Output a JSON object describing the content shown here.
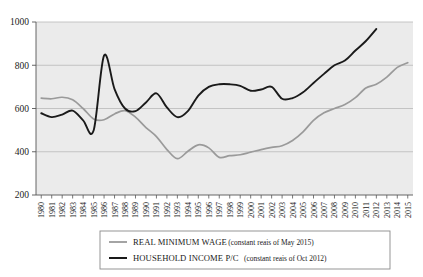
{
  "chart_data": {
    "type": "line",
    "title": "",
    "xlabel": "",
    "ylabel": "",
    "ylim": [
      200,
      1000
    ],
    "yticks": [
      200,
      400,
      600,
      800,
      1000
    ],
    "grid": true,
    "legend_position": "bottom",
    "plot_background": "#ebebeb",
    "x": [
      1980,
      1981,
      1982,
      1983,
      1984,
      1985,
      1986,
      1987,
      1988,
      1989,
      1990,
      1991,
      1992,
      1993,
      1994,
      1995,
      1996,
      1997,
      1998,
      1999,
      2000,
      2001,
      2002,
      2003,
      2004,
      2005,
      2006,
      2007,
      2008,
      2009,
      2010,
      2011,
      2012,
      2013,
      2014,
      2015
    ],
    "categories": [
      "1980",
      "1981",
      "1982",
      "1983",
      "1984",
      "1985",
      "1986",
      "1987",
      "1988",
      "1989",
      "1990",
      "1991",
      "1992",
      "1993",
      "1994",
      "1995",
      "1996",
      "1997",
      "1998",
      "1999",
      "2000",
      "2001",
      "2002",
      "2003",
      "2004",
      "2005",
      "2006",
      "2007",
      "2008",
      "2009",
      "2010",
      "2011",
      "2012",
      "2013",
      "2014",
      "2015"
    ],
    "series": [
      {
        "name": "REAL MINIMUM WAGE",
        "units": "constant reais of May 2015",
        "color": "#9a9a9a",
        "values": [
          648,
          645,
          652,
          640,
          600,
          552,
          548,
          575,
          590,
          560,
          512,
          470,
          410,
          368,
          402,
          432,
          418,
          374,
          382,
          386,
          398,
          410,
          420,
          428,
          452,
          492,
          545,
          580,
          600,
          618,
          650,
          695,
          712,
          745,
          790,
          812
        ]
      },
      {
        "name": "HOUSEHOLD INCOME P/C",
        "units": "constant reais of Oct 2012",
        "color": "#1a1a1a",
        "values": [
          578,
          560,
          572,
          590,
          545,
          498,
          845,
          690,
          600,
          588,
          628,
          670,
          605,
          560,
          588,
          660,
          700,
          712,
          712,
          705,
          682,
          688,
          700,
          645,
          648,
          675,
          718,
          760,
          800,
          822,
          868,
          912,
          968,
          null,
          null,
          null
        ]
      }
    ]
  },
  "legend": {
    "items": [
      {
        "label": "REAL MINIMUM WAGE",
        "note": "(constant reais of May 2015)",
        "color": "#9a9a9a"
      },
      {
        "label": "HOUSEHOLD INCOME P/C",
        "note": "(constant reais of Oct 2012)",
        "color": "#1a1a1a"
      }
    ]
  }
}
